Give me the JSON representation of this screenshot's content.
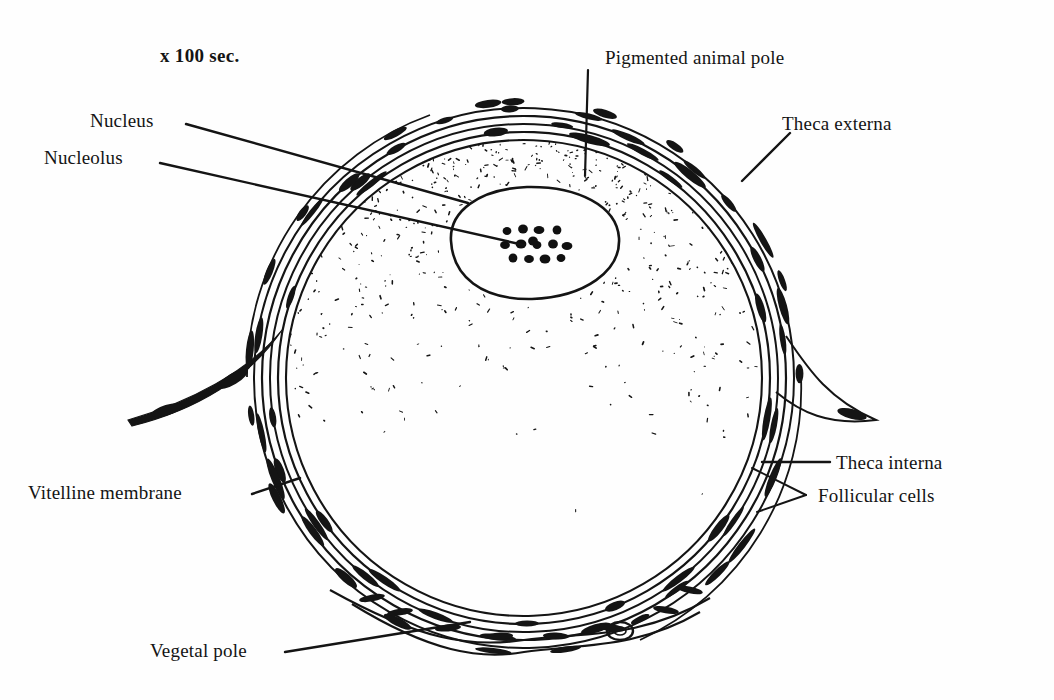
{
  "figure": {
    "title_text": "x 100 sec.",
    "ink_color": "#141414",
    "background_color": "#fefefe"
  },
  "scale_note": {
    "text": "x 100 sec.",
    "x": 160,
    "y": 45
  },
  "labels": [
    {
      "id": "pigmented-animal-pole",
      "text": "Pigmented animal pole",
      "x": 605,
      "y": 47,
      "leader": {
        "type": "line",
        "x1": 588,
        "y1": 70,
        "x2": 585,
        "y2": 176
      }
    },
    {
      "id": "theca-externa",
      "text": "Theca externa",
      "x": 782,
      "y": 113,
      "leader": {
        "type": "line",
        "x1": 790,
        "y1": 133,
        "x2": 742,
        "y2": 181
      }
    },
    {
      "id": "nucleus",
      "text": "Nucleus",
      "x": 90,
      "y": 110,
      "leader": {
        "type": "line",
        "x1": 186,
        "y1": 124,
        "x2": 468,
        "y2": 203
      }
    },
    {
      "id": "nucleolus",
      "text": "Nucleolus",
      "x": 44,
      "y": 147,
      "leader": {
        "type": "line",
        "x1": 160,
        "y1": 163,
        "x2": 524,
        "y2": 245
      }
    },
    {
      "id": "theca-interna",
      "text": "Theca interna",
      "x": 836,
      "y": 452,
      "leader": {
        "type": "line",
        "x1": 830,
        "y1": 462,
        "x2": 762,
        "y2": 462
      }
    },
    {
      "id": "follicular-cells",
      "text": "Follicular cells",
      "x": 818,
      "y": 485,
      "leader": {
        "type": "fork",
        "tip_x": 806,
        "tip_y": 495,
        "a_x": 752,
        "a_y": 468,
        "b_x": 757,
        "b_y": 512
      }
    },
    {
      "id": "vitelline-membrane",
      "text": "Vitelline membrane",
      "x": 28,
      "y": 482,
      "leader": {
        "type": "line",
        "x1": 252,
        "y1": 494,
        "x2": 300,
        "y2": 478
      }
    },
    {
      "id": "vegetal-pole",
      "text": "Vegetal pole",
      "x": 150,
      "y": 640,
      "leader": {
        "type": "line",
        "x1": 285,
        "y1": 652,
        "x2": 470,
        "y2": 622
      }
    }
  ],
  "oocyte": {
    "center_x": 524,
    "center_y": 377,
    "cytoplasm_radius": 238,
    "wall_layer_radii": [
      244,
      252,
      259,
      266,
      273
    ],
    "nucleus": {
      "center_x": 535,
      "center_y": 243,
      "rx": 84,
      "ry": 56,
      "nucleoli_count": 14
    },
    "pigment": {
      "region": "animal pole (upper hemisphere)",
      "density": "dense at top, fading downward"
    },
    "appendages": [
      {
        "id": "left-strand",
        "description": "tapering strand with two spindle nuclei extending to lower left"
      },
      {
        "id": "right-flap",
        "description": "pointed flap with nucleus projecting right"
      }
    ],
    "vegetal_cell": {
      "x": 620,
      "y": 631,
      "rx": 13,
      "ry": 9
    }
  }
}
